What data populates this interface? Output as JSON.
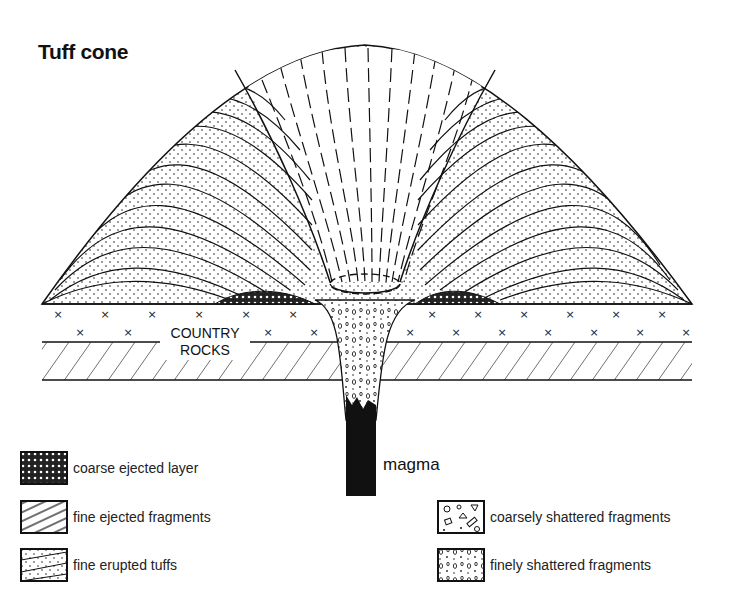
{
  "title": "Tuff cone",
  "labels": {
    "country_rocks_line1": "COUNTRY",
    "country_rocks_line2": "ROCKS",
    "magma": "magma"
  },
  "legend": [
    {
      "pattern": "coarse-dark",
      "label": "coarse ejected layer"
    },
    {
      "pattern": "diagonal-lines",
      "label": "fine ejected fragments"
    },
    {
      "pattern": "dotted-lines",
      "label": "fine erupted tuffs"
    },
    {
      "pattern": "coarse-shattered",
      "label": "coarsely shattered fragments"
    },
    {
      "pattern": "fine-shattered",
      "label": "finely shattered fragments"
    }
  ]
}
